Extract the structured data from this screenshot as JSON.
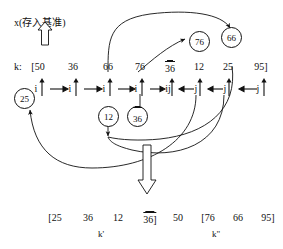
{
  "figure": {
    "pivot_note": "x(存入基准)",
    "k_row_label": "k:",
    "k_values": [
      "[50",
      "36",
      "66",
      "76",
      "36",
      "12",
      "25",
      "95]"
    ],
    "k_overline": [
      false,
      false,
      false,
      false,
      true,
      false,
      false,
      false
    ],
    "pointer_labels": [
      "i",
      "i",
      "i",
      "i",
      "ij",
      "j",
      "j",
      "j"
    ],
    "bubbles_top": [
      {
        "value": "76",
        "overline": false
      },
      {
        "value": "66",
        "overline": false
      }
    ],
    "bubbles_bottom": [
      {
        "value": "25",
        "overline": false
      },
      {
        "value": "12",
        "overline": false
      },
      {
        "value": "36",
        "overline": true
      }
    ],
    "result_values": [
      "[25",
      "36",
      "12",
      "36]",
      "50",
      "[76",
      "66",
      "95]"
    ],
    "result_overline": [
      false,
      false,
      false,
      true,
      false,
      false,
      false,
      false
    ],
    "result_sub_left": "k'",
    "result_sub_right": "k\"",
    "colors": {
      "ink": "#111111",
      "background": "#ffffff"
    }
  }
}
